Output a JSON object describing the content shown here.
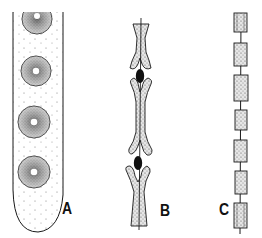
{
  "figure": {
    "panels": [
      {
        "id": "A",
        "label": "A",
        "description": "ascus-like tube containing four circular stippled spores with light central pores",
        "spore_count": 4,
        "spores": [
          {
            "cx": 37,
            "cy": 19,
            "r": 15,
            "partial": true
          },
          {
            "cx": 36,
            "cy": 71,
            "r": 15
          },
          {
            "cx": 34,
            "cy": 122,
            "r": 16
          },
          {
            "cx": 34,
            "cy": 172,
            "r": 16
          }
        ]
      },
      {
        "id": "B",
        "label": "B",
        "description": "chain of H-shaped stippled segments along a central strand, with dark oval bodies at the junctions",
        "dark_bodies": [
          {
            "cx": 140,
            "cy": 76
          },
          {
            "cx": 138,
            "cy": 163
          }
        ]
      },
      {
        "id": "C",
        "label": "C",
        "description": "linear chain of rectangular stippled cells threaded on a central strand",
        "cells": [
          {
            "y": 13,
            "h": 19,
            "partial": true
          },
          {
            "y": 43,
            "h": 23
          },
          {
            "y": 75,
            "h": 26
          },
          {
            "y": 110,
            "h": 20
          },
          {
            "y": 140,
            "h": 22
          },
          {
            "y": 171,
            "h": 23
          },
          {
            "y": 203,
            "h": 25,
            "partial": true
          }
        ]
      }
    ],
    "colors": {
      "ink": "#1a1a1a",
      "stipple": "#6e6e6e",
      "background": "#ffffff"
    }
  }
}
